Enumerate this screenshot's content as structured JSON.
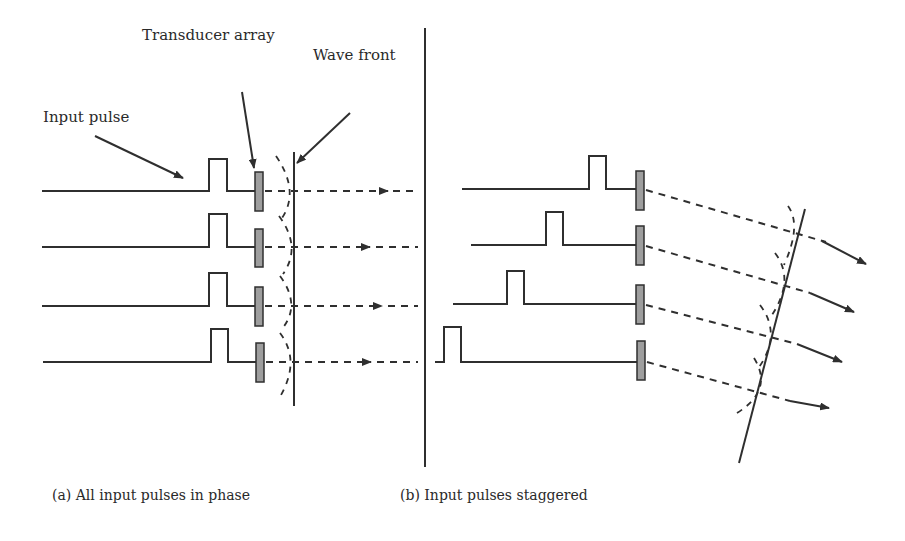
{
  "labels": {
    "transducer_array": "Transducer array",
    "wave_front": "Wave front",
    "input_pulse": "Input pulse"
  },
  "captions": {
    "panel_a": "(a) All input pulses in phase",
    "panel_b": "(b) Input pulses staggered"
  },
  "panels": [
    {
      "id": "a",
      "elements": 4,
      "pulse_timing": "in phase",
      "wave_front": "vertical"
    },
    {
      "id": "b",
      "elements": 4,
      "pulse_timing": "staggered",
      "wave_front": "tilted"
    }
  ],
  "colors": {
    "stroke": "#2f2f2f",
    "transducer_fill": "#9e9e9e",
    "background": "#ffffff"
  }
}
